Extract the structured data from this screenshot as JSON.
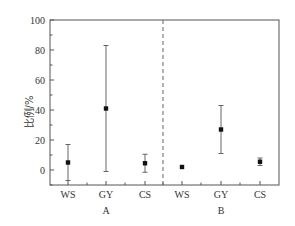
{
  "chart_data": {
    "type": "scatter",
    "subtype": "point-with-error-bars",
    "title": "",
    "xlabel": "",
    "ylabel": "比例/%",
    "ylim": [
      -10,
      100
    ],
    "yticks": [
      0,
      20,
      40,
      60,
      80,
      100
    ],
    "grid": false,
    "legend": null,
    "groups": [
      {
        "name": "A",
        "categories": [
          "WS",
          "GY",
          "CS"
        ],
        "values": [
          5,
          41,
          4.5
        ],
        "error_upper": [
          17,
          83,
          10.5
        ],
        "error_lower": [
          -7,
          -1,
          -1.5
        ]
      },
      {
        "name": "B",
        "categories": [
          "WS",
          "GY",
          "CS"
        ],
        "values": [
          2,
          27,
          5.5
        ],
        "error_upper": [
          2,
          43,
          8
        ],
        "error_lower": [
          2,
          11,
          3
        ]
      }
    ],
    "separator": "dashed vertical line between group A and group B"
  },
  "colors": {
    "axis": "#555555",
    "marker": "#111111",
    "errorbar": "#666666",
    "separator": "#666666"
  }
}
